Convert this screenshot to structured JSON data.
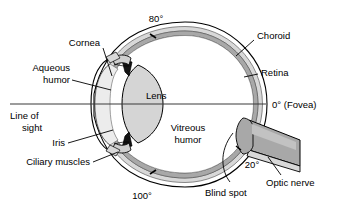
{
  "diagram": {
    "background_color": "#ffffff",
    "line_color": "#000000",
    "colors": {
      "sclera": "#ffffff",
      "choroid_band": "#d8d8d8",
      "retina_band": "#a8a8a8",
      "lens_fill": "#d5d5d5",
      "vitreous_fill": "#ffffff",
      "aqueous_fill": "#e8e8e8",
      "ciliary_fill": "#cfcfcf",
      "optic_nerve_fill": "#a8a8a8",
      "iris_fill": "#1a1a1a",
      "sight_line": "#3a3a3a"
    },
    "labels": {
      "cornea": "Cornea",
      "aqueous_humor_line1": "Aqueous",
      "aqueous_humor_line2": "humor",
      "lens": "Lens",
      "iris": "Iris",
      "ciliary_muscles": "Ciliary muscles",
      "line_of_sight_line1": "Line of",
      "line_of_sight_line2": "sight",
      "vitreous_humor_line1": "Vitreous",
      "vitreous_humor_line2": "humor",
      "choroid": "Choroid",
      "retina": "Retina",
      "fovea": "0°  (Fovea)",
      "optic_nerve": "Optic nerve",
      "blind_spot": "Blind spot"
    },
    "angle_markers": {
      "top": "80°",
      "bottom": "100°",
      "optic_nerve": "20°",
      "fovea": "0°"
    }
  }
}
